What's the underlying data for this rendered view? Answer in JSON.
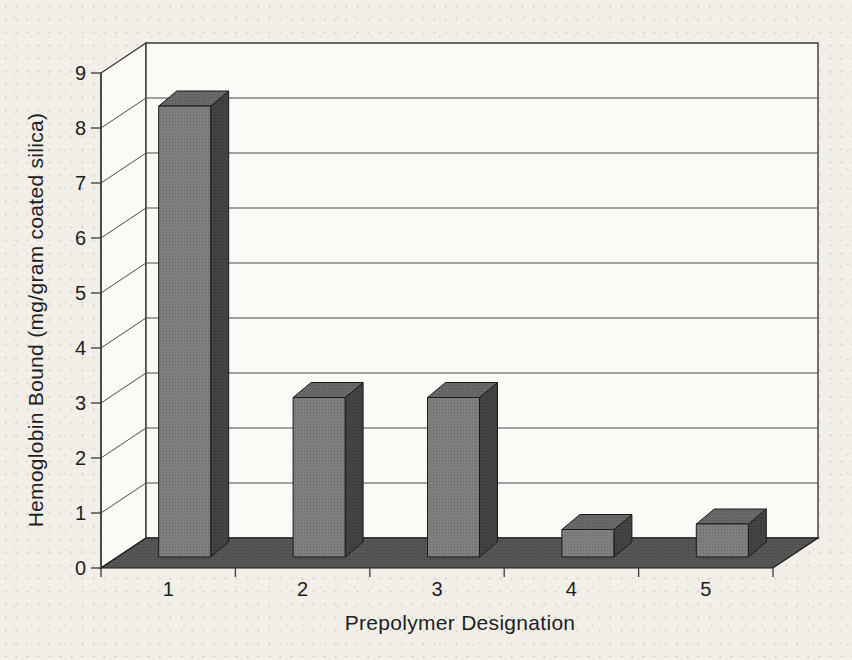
{
  "page": {
    "background": "#f2efe9"
  },
  "chart_data": {
    "type": "bar",
    "style": "3d-column-grayscale",
    "title": "",
    "xlabel": "Prepolymer Designation",
    "ylabel": "Hemoglobin Bound (mg/gram coated silica)",
    "categories": [
      "1",
      "2",
      "3",
      "4",
      "5"
    ],
    "values": [
      8.2,
      2.9,
      2.9,
      0.5,
      0.6
    ],
    "ylim": [
      0,
      9
    ],
    "ytick_step": 1,
    "yticks": [
      "0",
      "1",
      "2",
      "3",
      "4",
      "5",
      "6",
      "7",
      "8",
      "9"
    ],
    "grid": true,
    "legend": null,
    "colors": {
      "bar_front": "#7f7f7f",
      "bar_front_dot": "#666666",
      "bar_top": "#686868",
      "bar_top_dot": "#555555",
      "bar_side": "#434343",
      "bar_side_dot": "#333333",
      "floor": "#555555",
      "floor_dot": "#434343",
      "wall": "#fbfaf6",
      "gridline": "#4a4a4a",
      "frame": "#3a3a3a",
      "outline": "#1a1a1a",
      "text": "#1e1e1e"
    }
  }
}
